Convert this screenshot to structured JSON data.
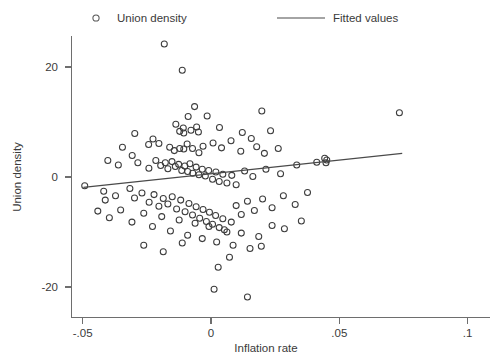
{
  "chart_data": {
    "type": "scatter",
    "title": "",
    "xlabel": "Inflation rate",
    "ylabel": "Union density",
    "xlim": [
      -0.055,
      0.104
    ],
    "ylim": [
      -26.5,
      28.0
    ],
    "grid": false,
    "legend_position": "top",
    "xticks": [
      -0.05,
      0,
      0.05,
      0.1
    ],
    "xticklabels": [
      "-.05",
      "0",
      ".05",
      ".1"
    ],
    "yticks": [
      20,
      0,
      -20
    ],
    "yticklabels": [
      "20",
      "0",
      "-20"
    ],
    "series": [
      {
        "name": "Union density",
        "type": "scatter",
        "marker": "open-circle",
        "color": "#3c3c3c",
        "points": [
          [
            -0.0182,
            24.2
          ],
          [
            -0.0112,
            19.4
          ],
          [
            -0.0064,
            12.8
          ],
          [
            -0.0089,
            11.0
          ],
          [
            -0.0015,
            11.1
          ],
          [
            0.0198,
            12.0
          ],
          [
            0.0734,
            11.7
          ],
          [
            -0.0297,
            7.9
          ],
          [
            -0.0226,
            6.9
          ],
          [
            -0.0137,
            9.6
          ],
          [
            -0.0122,
            8.3
          ],
          [
            -0.0108,
            8.9
          ],
          [
            -0.0106,
            8.0
          ],
          [
            -0.0078,
            8.5
          ],
          [
            -0.0056,
            9.1
          ],
          [
            -0.0049,
            8.2
          ],
          [
            0.0033,
            9.0
          ],
          [
            0.0122,
            8.1
          ],
          [
            0.0157,
            7.0
          ],
          [
            0.0232,
            8.4
          ],
          [
            -0.0345,
            5.4
          ],
          [
            -0.0307,
            3.9
          ],
          [
            -0.0243,
            5.9
          ],
          [
            -0.0203,
            6.1
          ],
          [
            -0.0161,
            5.4
          ],
          [
            -0.0143,
            4.8
          ],
          [
            -0.0122,
            5.2
          ],
          [
            -0.0106,
            5.1
          ],
          [
            -0.0093,
            6.0
          ],
          [
            -0.0072,
            5.2
          ],
          [
            -0.0047,
            4.4
          ],
          [
            -0.0031,
            5.6
          ],
          [
            0.0008,
            6.2
          ],
          [
            0.0041,
            5.3
          ],
          [
            0.0078,
            6.6
          ],
          [
            0.0116,
            4.7
          ],
          [
            0.0178,
            5.5
          ],
          [
            0.0208,
            4.3
          ],
          [
            0.0262,
            5.2
          ],
          [
            -0.0402,
            3.0
          ],
          [
            -0.0361,
            2.2
          ],
          [
            -0.0285,
            2.6
          ],
          [
            -0.0242,
            1.6
          ],
          [
            -0.0215,
            3.0
          ],
          [
            -0.0196,
            2.1
          ],
          [
            -0.0178,
            2.6
          ],
          [
            -0.0168,
            1.5
          ],
          [
            -0.0152,
            2.8
          ],
          [
            -0.0139,
            1.9
          ],
          [
            -0.0126,
            2.3
          ],
          [
            -0.0114,
            1.2
          ],
          [
            -0.0102,
            2.0
          ],
          [
            -0.0091,
            1.0
          ],
          [
            -0.0082,
            2.4
          ],
          [
            -0.0071,
            0.7
          ],
          [
            -0.0058,
            1.8
          ],
          [
            -0.0047,
            0.4
          ],
          [
            -0.0034,
            1.4
          ],
          [
            -0.0022,
            0.2
          ],
          [
            -0.0009,
            1.2
          ],
          [
            0.0006,
            -0.4
          ],
          [
            0.0019,
            0.9
          ],
          [
            0.0032,
            -0.8
          ],
          [
            0.0046,
            0.5
          ],
          [
            0.0062,
            -1.1
          ],
          [
            0.0081,
            0.3
          ],
          [
            0.0098,
            -1.4
          ],
          [
            0.0131,
            1.1
          ],
          [
            0.0163,
            0.1
          ],
          [
            0.0214,
            1.4
          ],
          [
            0.0271,
            0.6
          ],
          [
            0.0334,
            2.2
          ],
          [
            0.0412,
            2.7
          ],
          [
            0.0443,
            3.4
          ],
          [
            0.0451,
            3.1
          ],
          [
            0.0448,
            2.6
          ],
          [
            -0.0492,
            -1.6
          ],
          [
            -0.0418,
            -2.6
          ],
          [
            -0.0372,
            -3.4
          ],
          [
            -0.0316,
            -2.1
          ],
          [
            -0.0298,
            -3.8
          ],
          [
            -0.0269,
            -2.9
          ],
          [
            -0.0241,
            -4.6
          ],
          [
            -0.0222,
            -3.2
          ],
          [
            -0.0203,
            -5.3
          ],
          [
            -0.0186,
            -3.9
          ],
          [
            -0.0168,
            -4.9
          ],
          [
            -0.0151,
            -3.6
          ],
          [
            -0.0134,
            -5.8
          ],
          [
            -0.0118,
            -4.2
          ],
          [
            -0.0101,
            -6.3
          ],
          [
            -0.0086,
            -4.8
          ],
          [
            -0.0072,
            -6.9
          ],
          [
            -0.0058,
            -5.4
          ],
          [
            -0.0044,
            -7.5
          ],
          [
            -0.0031,
            -5.9
          ],
          [
            -0.0018,
            -8.1
          ],
          [
            -0.0006,
            -6.4
          ],
          [
            0.0006,
            -8.6
          ],
          [
            0.0018,
            -7.0
          ],
          [
            0.0032,
            -9.2
          ],
          [
            0.0046,
            -7.6
          ],
          [
            0.0062,
            -10.0
          ],
          [
            0.0079,
            -8.2
          ],
          [
            0.0098,
            -5.2
          ],
          [
            0.0118,
            -6.8
          ],
          [
            0.0142,
            -4.4
          ],
          [
            0.0169,
            -6.1
          ],
          [
            0.0201,
            -4.0
          ],
          [
            0.0238,
            -5.6
          ],
          [
            0.0282,
            -3.4
          ],
          [
            0.0328,
            -5.0
          ],
          [
            0.0376,
            -2.8
          ],
          [
            -0.0441,
            -6.2
          ],
          [
            -0.0396,
            -7.4
          ],
          [
            -0.0352,
            -6.0
          ],
          [
            -0.0308,
            -8.2
          ],
          [
            -0.0262,
            -6.6
          ],
          [
            -0.0228,
            -9.0
          ],
          [
            -0.0192,
            -7.2
          ],
          [
            -0.0158,
            -9.8
          ],
          [
            -0.0124,
            -7.8
          ],
          [
            -0.0091,
            -10.6
          ],
          [
            -0.0062,
            -8.4
          ],
          [
            -0.0034,
            -11.2
          ],
          [
            -0.0008,
            -9.0
          ],
          [
            0.0022,
            -11.8
          ],
          [
            0.0052,
            -9.6
          ],
          [
            0.0086,
            -12.4
          ],
          [
            0.0118,
            -10.2
          ],
          [
            0.0152,
            -13.0
          ],
          [
            0.0186,
            -10.8
          ],
          [
            0.0072,
            -14.6
          ],
          [
            0.0028,
            -16.4
          ],
          [
            0.0012,
            -20.4
          ],
          [
            0.0142,
            -21.8
          ],
          [
            -0.0262,
            -12.4
          ],
          [
            -0.0186,
            -13.6
          ],
          [
            -0.0112,
            -12.0
          ],
          [
            0.0238,
            -8.8
          ],
          [
            0.0286,
            -9.4
          ],
          [
            0.0196,
            -12.6
          ],
          [
            -0.0412,
            -4.2
          ],
          [
            0.0352,
            -8.0
          ]
        ]
      },
      {
        "name": "Fitted values",
        "type": "line",
        "color": "#4a4a4a",
        "endpoints": [
          [
            -0.0497,
            -1.9
          ],
          [
            0.0745,
            4.3
          ]
        ]
      }
    ]
  },
  "legend": {
    "items": [
      {
        "label": "Union density",
        "marker": "open-circle"
      },
      {
        "label": "Fitted values",
        "marker": "line"
      }
    ]
  }
}
